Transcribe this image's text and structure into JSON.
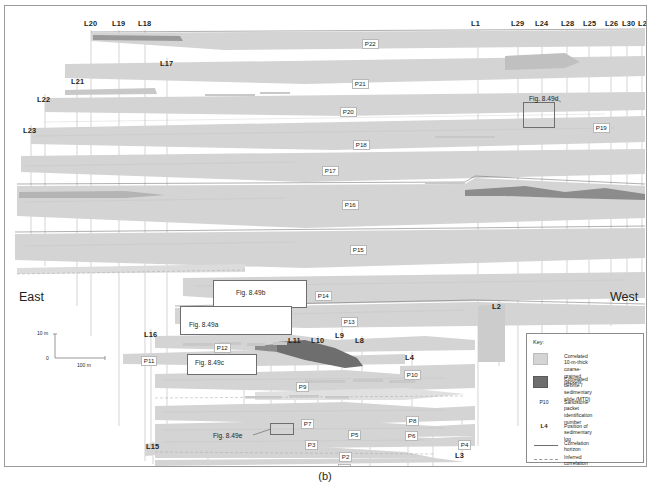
{
  "figure": {
    "caption": "(b)",
    "direction_left": "East",
    "direction_right": "West"
  },
  "scale_bar": {
    "vertical_label": "10 m",
    "origin_label": "0",
    "horizontal_label": "100 m"
  },
  "key": {
    "title": "Key:",
    "items": [
      {
        "symbol": "packet-swatch",
        "label": "Correlated 10-m-thick\ncoarse-grained packets"
      },
      {
        "symbol": "mtd-swatch",
        "label": "Correlated debrite /\nsedimentary slide (MTD)"
      },
      {
        "symbol": "P10",
        "label": "Sandstone packet\nidentification\nnumber"
      },
      {
        "symbol": "L4",
        "label": "Position of sedimentary\nlog"
      },
      {
        "symbol": "solid-line",
        "label": "Correlation\nhorizon"
      },
      {
        "symbol": "dashed-line",
        "label": "Inferred\ncorrelation"
      }
    ]
  },
  "colors": {
    "packet_fill": "#d4d4d4",
    "mtd_fill": "#6e6e6e",
    "horizon_line": "#6e6e6e",
    "log_line": "#b0b0b0",
    "text": "#231f20",
    "frame": "#9a9a9a"
  },
  "log_labels": [
    {
      "id": "L20",
      "x": 79,
      "y": 14
    },
    {
      "id": "L19",
      "x": 107,
      "y": 14
    },
    {
      "id": "L18",
      "x": 133,
      "y": 14
    },
    {
      "id": "L1",
      "x": 466,
      "y": 14
    },
    {
      "id": "L29",
      "x": 506,
      "y": 14
    },
    {
      "id": "L24",
      "x": 530,
      "y": 14
    },
    {
      "id": "L28",
      "x": 556,
      "y": 14
    },
    {
      "id": "L25",
      "x": 578,
      "y": 14
    },
    {
      "id": "L26",
      "x": 600,
      "y": 14
    },
    {
      "id": "L30",
      "x": 617,
      "y": 14
    },
    {
      "id": "L27",
      "x": 633,
      "y": 14
    },
    {
      "id": "L17",
      "x": 155,
      "y": 54
    },
    {
      "id": "L21",
      "x": 66,
      "y": 72
    },
    {
      "id": "L22",
      "x": 32,
      "y": 90
    },
    {
      "id": "L23",
      "x": 18,
      "y": 121
    },
    {
      "id": "L2",
      "x": 487,
      "y": 297
    },
    {
      "id": "L16",
      "x": 139,
      "y": 325
    },
    {
      "id": "L13",
      "x": 232,
      "y": 306
    },
    {
      "id": "L12",
      "x": 259,
      "y": 306
    },
    {
      "id": "L11",
      "x": 283,
      "y": 331
    },
    {
      "id": "L10",
      "x": 306,
      "y": 331
    },
    {
      "id": "L9",
      "x": 330,
      "y": 326
    },
    {
      "id": "L8",
      "x": 350,
      "y": 331
    },
    {
      "id": "L4",
      "x": 400,
      "y": 348
    },
    {
      "id": "L15",
      "x": 141,
      "y": 437
    },
    {
      "id": "L14",
      "x": 196,
      "y": 468
    },
    {
      "id": "L7",
      "x": 358,
      "y": 467
    },
    {
      "id": "L6",
      "x": 396,
      "y": 467
    },
    {
      "id": "L5",
      "x": 421,
      "y": 467
    },
    {
      "id": "L3",
      "x": 450,
      "y": 446
    }
  ],
  "packet_labels": [
    {
      "id": "P22",
      "x": 357,
      "y": 33
    },
    {
      "id": "P21",
      "x": 347,
      "y": 73
    },
    {
      "id": "P20",
      "x": 335,
      "y": 101
    },
    {
      "id": "P19",
      "x": 588,
      "y": 117
    },
    {
      "id": "P18",
      "x": 348,
      "y": 134
    },
    {
      "id": "P17",
      "x": 317,
      "y": 160
    },
    {
      "id": "P16",
      "x": 337,
      "y": 194
    },
    {
      "id": "P15",
      "x": 345,
      "y": 239
    },
    {
      "id": "P14",
      "x": 310,
      "y": 285
    },
    {
      "id": "P13",
      "x": 336,
      "y": 311
    },
    {
      "id": "P12",
      "x": 209,
      "y": 337
    },
    {
      "id": "P11",
      "x": 136,
      "y": 350
    },
    {
      "id": "P10",
      "x": 399,
      "y": 364
    },
    {
      "id": "P9",
      "x": 291,
      "y": 376
    },
    {
      "id": "P8",
      "x": 401,
      "y": 410
    },
    {
      "id": "P7",
      "x": 296,
      "y": 413
    },
    {
      "id": "P6",
      "x": 400,
      "y": 425
    },
    {
      "id": "P5",
      "x": 343,
      "y": 424
    },
    {
      "id": "P4",
      "x": 453,
      "y": 434
    },
    {
      "id": "P3",
      "x": 300,
      "y": 434
    },
    {
      "id": "P2",
      "x": 334,
      "y": 446
    },
    {
      "id": "P1",
      "x": 333,
      "y": 458
    }
  ],
  "fig_callouts": [
    {
      "id": "Fig. 8.49d",
      "x": 524,
      "y": 90
    },
    {
      "id": "Fig. 8.49b",
      "x": 231,
      "y": 284
    },
    {
      "id": "Fig. 8.49a",
      "x": 184,
      "y": 316
    },
    {
      "id": "Fig. 8.49c",
      "x": 190,
      "y": 354
    },
    {
      "id": "Fig. 8.49e",
      "x": 208,
      "y": 427
    }
  ]
}
